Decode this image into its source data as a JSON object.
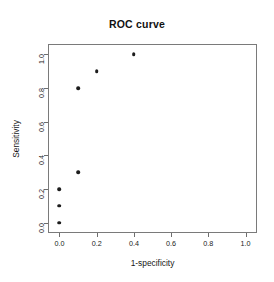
{
  "chart_data": {
    "type": "scatter",
    "title": "ROC curve",
    "xlabel": "1-specificity",
    "ylabel": "Sensitivity",
    "xlim": [
      0.0,
      1.0
    ],
    "ylim": [
      0.0,
      1.0
    ],
    "grid": false,
    "legend": null,
    "xticks": [
      "0.0",
      "0.2",
      "0.4",
      "0.6",
      "0.8",
      "1.0"
    ],
    "xtick_values": [
      0.0,
      0.2,
      0.4,
      0.6,
      0.8,
      1.0
    ],
    "yticks": [
      "0.0",
      "0.2",
      "0.4",
      "0.6",
      "0.8",
      "1.0"
    ],
    "ytick_values": [
      0.0,
      0.2,
      0.4,
      0.6,
      0.8,
      1.0
    ],
    "marker": "filled-circle",
    "marker_color": "#1c1c1c",
    "points": [
      {
        "x": 0.0,
        "y": 0.0
      },
      {
        "x": 0.0,
        "y": 0.1
      },
      {
        "x": 0.0,
        "y": 0.2
      },
      {
        "x": 0.1,
        "y": 0.3
      },
      {
        "x": 0.1,
        "y": 0.8
      },
      {
        "x": 0.2,
        "y": 0.9
      },
      {
        "x": 0.4,
        "y": 1.0
      }
    ],
    "x": [
      0.0,
      0.0,
      0.0,
      0.1,
      0.1,
      0.2,
      0.4
    ],
    "values": [
      0.0,
      0.1,
      0.2,
      0.3,
      0.8,
      0.9,
      1.0
    ]
  },
  "colors": {
    "background": "#ffffff",
    "frame": "#7a7a7a",
    "axis": "#6e6e6e",
    "text": "#161616",
    "point": "#1c1c1c"
  }
}
